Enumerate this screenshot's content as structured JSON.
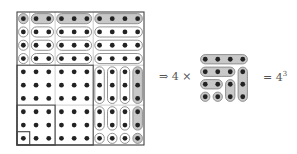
{
  "figure": {
    "type": "visual proof: sum of first n cubes",
    "big_grid": {
      "size": 10,
      "origin": [
        17,
        12
      ],
      "cell_w": 12.7,
      "cell_h": 13.3,
      "pills": [
        {
          "r0": 0,
          "c0": 0,
          "r1": 0,
          "c1": 0,
          "shaded": true
        },
        {
          "r0": 0,
          "c0": 1,
          "r1": 0,
          "c1": 2,
          "shaded": true
        },
        {
          "r0": 0,
          "c0": 3,
          "r1": 0,
          "c1": 5,
          "shaded": true
        },
        {
          "r0": 0,
          "c0": 6,
          "r1": 0,
          "c1": 9,
          "shaded": true
        },
        {
          "r0": 1,
          "c0": 0,
          "r1": 1,
          "c1": 0
        },
        {
          "r0": 1,
          "c0": 1,
          "r1": 1,
          "c1": 2
        },
        {
          "r0": 1,
          "c0": 3,
          "r1": 1,
          "c1": 5
        },
        {
          "r0": 1,
          "c0": 6,
          "r1": 1,
          "c1": 9
        },
        {
          "r0": 2,
          "c0": 0,
          "r1": 2,
          "c1": 0
        },
        {
          "r0": 2,
          "c0": 1,
          "r1": 2,
          "c1": 2
        },
        {
          "r0": 2,
          "c0": 3,
          "r1": 2,
          "c1": 5
        },
        {
          "r0": 2,
          "c0": 6,
          "r1": 2,
          "c1": 9
        },
        {
          "r0": 3,
          "c0": 0,
          "r1": 3,
          "c1": 0
        },
        {
          "r0": 3,
          "c0": 1,
          "r1": 3,
          "c1": 2
        },
        {
          "r0": 3,
          "c0": 3,
          "r1": 3,
          "c1": 5
        },
        {
          "r0": 3,
          "c0": 6,
          "r1": 3,
          "c1": 9
        },
        {
          "r0": 4,
          "c0": 6,
          "r1": 6,
          "c1": 6
        },
        {
          "r0": 4,
          "c0": 7,
          "r1": 6,
          "c1": 7
        },
        {
          "r0": 4,
          "c0": 8,
          "r1": 6,
          "c1": 8
        },
        {
          "r0": 4,
          "c0": 9,
          "r1": 6,
          "c1": 9,
          "shaded": true
        },
        {
          "r0": 7,
          "c0": 6,
          "r1": 8,
          "c1": 6
        },
        {
          "r0": 7,
          "c0": 7,
          "r1": 8,
          "c1": 7
        },
        {
          "r0": 7,
          "c0": 8,
          "r1": 8,
          "c1": 8
        },
        {
          "r0": 7,
          "c0": 9,
          "r1": 8,
          "c1": 9,
          "shaded": true
        },
        {
          "r0": 9,
          "c0": 6,
          "r1": 9,
          "c1": 6
        },
        {
          "r0": 9,
          "c0": 7,
          "r1": 9,
          "c1": 7
        },
        {
          "r0": 9,
          "c0": 8,
          "r1": 9,
          "c1": 8
        },
        {
          "r0": 9,
          "c0": 9,
          "r1": 9,
          "c1": 9,
          "shaded": true
        }
      ],
      "thick_boxes": [
        {
          "r0": 0,
          "c0": 0,
          "r1": 9,
          "c1": 9
        },
        {
          "r0": 4,
          "c0": 0,
          "r1": 9,
          "c1": 5
        },
        {
          "r0": 7,
          "c0": 0,
          "r1": 9,
          "c1": 2
        },
        {
          "r0": 9,
          "c0": 0,
          "r1": 9,
          "c1": 0
        }
      ],
      "thin_lines": {
        "v": [
          {
            "c": 1,
            "r0": 0,
            "r1": 4
          },
          {
            "c": 3,
            "r0": 0,
            "r1": 10
          },
          {
            "c": 6,
            "r0": 0,
            "r1": 4
          }
        ],
        "h": [
          {
            "r": 4,
            "c0": 6,
            "c1": 10
          },
          {
            "r": 7,
            "c0": 3,
            "c1": 10
          }
        ]
      }
    },
    "small_grid": {
      "size": 4,
      "origin": [
        199,
        53
      ],
      "cell": 12.5,
      "pills": [
        {
          "r0": 0,
          "c0": 0,
          "r1": 0,
          "c1": 3
        },
        {
          "r0": 1,
          "c0": 0,
          "r1": 1,
          "c1": 2
        },
        {
          "r0": 2,
          "c0": 0,
          "r1": 2,
          "c1": 1
        },
        {
          "r0": 3,
          "c0": 0,
          "r1": 3,
          "c1": 0
        },
        {
          "r0": 3,
          "c0": 1,
          "r1": 3,
          "c1": 1
        },
        {
          "r0": 2,
          "c0": 2,
          "r1": 3,
          "c1": 2
        },
        {
          "r0": 1,
          "c0": 3,
          "r1": 3,
          "c1": 3
        }
      ]
    },
    "arrow_label": "⇒ 4 ×",
    "result_label": "= 4",
    "result_exponent": "3",
    "colors": {
      "dot": "#222222",
      "pill_stroke": "#888888",
      "pill_shaded": "#c8c8c8",
      "line": "#444444",
      "text": "#555555"
    }
  }
}
